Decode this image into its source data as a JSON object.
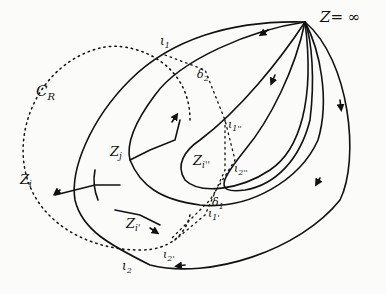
{
  "diagram": {
    "type": "hand-drawn contour / flow diagram",
    "labels": {
      "z_inf": "Z= ∞",
      "c_r": "C",
      "c_r_sub": "R",
      "zi": "Z",
      "zi_sub": "i",
      "zj": "Z",
      "zj_sub": "j",
      "zi1": "Z",
      "zi1_sub": "i'",
      "zi2": "Z",
      "zi2_sub": "i''",
      "l1": "ι",
      "l1_sub": "1",
      "l2": "ι",
      "l2_sub": "2",
      "l1p": "ι",
      "l1p_sub": "1'",
      "l2p": "ι",
      "l2p_sub": "2'",
      "l1pp": "ι",
      "l1pp_sub": "1''",
      "l2pp": "ι",
      "l2pp_sub": "2''",
      "d1": "δ",
      "d1_sub": "1",
      "d2": "δ",
      "d2_sub": "2"
    },
    "colors": {
      "ink": "#111111",
      "paper": "#fbfbfa"
    }
  }
}
